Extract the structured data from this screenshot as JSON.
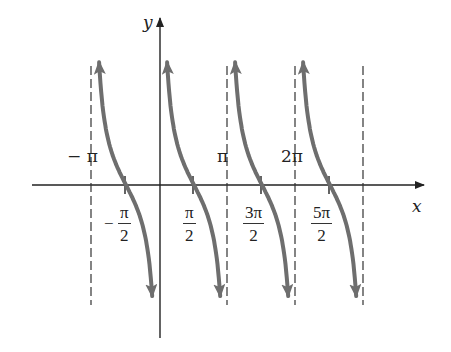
{
  "chart_data": {
    "type": "line",
    "title": "",
    "function": "y = cot x",
    "xlabel": "x",
    "ylabel": "y",
    "grid": false,
    "legend": null,
    "x_tick_labels_above_axis": [
      "−π",
      "π",
      "2π"
    ],
    "x_tick_labels_below_axis": [
      "−π/2",
      "π/2",
      "3π/2",
      "5π/2"
    ],
    "asymptotes": [
      "−π",
      "0",
      "π",
      "2π",
      "3π"
    ],
    "zeros": [
      "−π/2",
      "π/2",
      "3π/2",
      "5π/2"
    ],
    "branches": [
      {
        "interval": [
          "−π",
          "0"
        ],
        "zero": "−π/2"
      },
      {
        "interval": [
          "0",
          "π"
        ],
        "zero": "π/2"
      },
      {
        "interval": [
          "π",
          "2π"
        ],
        "zero": "3π/2"
      },
      {
        "interval": [
          "2π",
          "3π"
        ],
        "zero": "5π/2"
      }
    ],
    "xlim": [
      "-1.05π",
      "3.9π"
    ],
    "ylim": [
      -2.3,
      2.6
    ],
    "curve_color": "#6e6e6e",
    "axis_color": "#222222"
  },
  "labels": {
    "x_axis": "x",
    "y_axis": "y",
    "neg_pi": "− π",
    "pi": "π",
    "two_pi": "2π",
    "neg_half_pi": {
      "sign": "−",
      "num": "π",
      "den": "2"
    },
    "half_pi": {
      "num": "π",
      "den": "2"
    },
    "three_half_pi": {
      "num": "3π",
      "den": "2"
    },
    "five_half_pi": {
      "num": "5π",
      "den": "2"
    }
  }
}
